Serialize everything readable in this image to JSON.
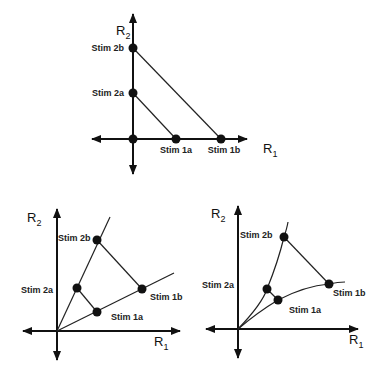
{
  "panels": [
    {
      "id": "top",
      "type": "linear-independent",
      "axis_x_label": "R",
      "axis_x_sub": "1",
      "axis_y_label": "R",
      "axis_y_sub": "2",
      "stimuli": [
        {
          "label": "Stim 2b"
        },
        {
          "label": "Stim 2a"
        },
        {
          "label": "Stim 1a"
        },
        {
          "label": "Stim 1b"
        }
      ]
    },
    {
      "id": "bottom-left",
      "type": "linear-rotated",
      "axis_x_label": "R",
      "axis_x_sub": "1",
      "axis_y_label": "R",
      "axis_y_sub": "2",
      "stimuli": [
        {
          "label": "Stim 2b"
        },
        {
          "label": "Stim 2a"
        },
        {
          "label": "Stim 1b"
        },
        {
          "label": "Stim 1a"
        }
      ]
    },
    {
      "id": "bottom-right",
      "type": "curved",
      "axis_x_label": "R",
      "axis_x_sub": "1",
      "axis_y_label": "R",
      "axis_y_sub": "2",
      "stimuli": [
        {
          "label": "Stim 2b"
        },
        {
          "label": "Stim 2a"
        },
        {
          "label": "Stim 1b"
        },
        {
          "label": "Stim 1a"
        }
      ]
    }
  ]
}
